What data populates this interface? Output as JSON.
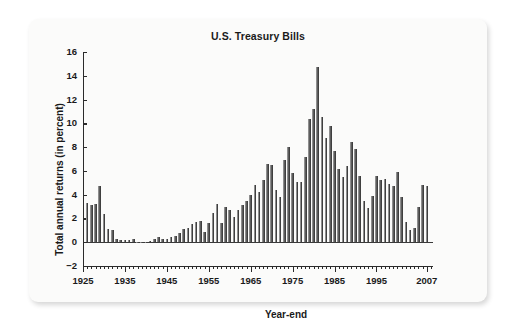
{
  "chart_data": {
    "type": "bar",
    "title": "U.S. Treasury Bills",
    "xlabel": "Year-end",
    "ylabel": "Total annual returns (in percent)",
    "ylim": [
      -2,
      16
    ],
    "xlim": [
      1925,
      2008
    ],
    "y_ticks": [
      16,
      14,
      12,
      10,
      8,
      6,
      4,
      2,
      0,
      -2
    ],
    "x_ticks": [
      1925,
      1935,
      1945,
      1955,
      1965,
      1975,
      1985,
      1995,
      2007
    ],
    "x_tick_labels": [
      "1925",
      "1935",
      "1945",
      "1955",
      "1965",
      "1975",
      "1985",
      "1995",
      "2007"
    ],
    "grid": false,
    "legend": null,
    "bar_color": "#5d5d5d",
    "background_color": "#fbfbfa",
    "axis_color": "#2b2b2b",
    "x": [
      1926,
      1927,
      1928,
      1929,
      1930,
      1931,
      1932,
      1933,
      1934,
      1935,
      1936,
      1937,
      1938,
      1939,
      1940,
      1941,
      1942,
      1943,
      1944,
      1945,
      1946,
      1947,
      1948,
      1949,
      1950,
      1951,
      1952,
      1953,
      1954,
      1955,
      1956,
      1957,
      1958,
      1959,
      1960,
      1961,
      1962,
      1963,
      1964,
      1965,
      1966,
      1967,
      1968,
      1969,
      1970,
      1971,
      1972,
      1973,
      1974,
      1975,
      1976,
      1977,
      1978,
      1979,
      1980,
      1981,
      1982,
      1983,
      1984,
      1985,
      1986,
      1987,
      1988,
      1989,
      1990,
      1991,
      1992,
      1993,
      1994,
      1995,
      1996,
      1997,
      1998,
      1999,
      2000,
      2001,
      2002,
      2003,
      2004,
      2005,
      2006,
      2007
    ],
    "values": [
      3.3,
      3.1,
      3.2,
      4.7,
      2.4,
      1.1,
      1.0,
      0.3,
      0.2,
      0.2,
      0.2,
      0.3,
      0.0,
      0.0,
      0.0,
      0.1,
      0.3,
      0.4,
      0.3,
      0.3,
      0.4,
      0.5,
      0.8,
      1.1,
      1.2,
      1.5,
      1.7,
      1.8,
      0.9,
      1.6,
      2.5,
      3.2,
      1.6,
      3.0,
      2.7,
      2.1,
      2.7,
      3.1,
      3.5,
      4.0,
      4.8,
      4.2,
      5.2,
      6.6,
      6.5,
      4.4,
      3.8,
      6.9,
      8.0,
      5.8,
      5.1,
      5.1,
      7.2,
      10.4,
      11.2,
      14.7,
      10.5,
      8.8,
      9.8,
      7.7,
      6.2,
      5.5,
      6.4,
      8.4,
      7.8,
      5.6,
      3.5,
      2.9,
      3.9,
      5.6,
      5.2,
      5.3,
      4.9,
      4.7,
      5.9,
      3.8,
      1.7,
      1.0,
      1.2,
      3.0,
      4.8,
      4.7
    ]
  }
}
